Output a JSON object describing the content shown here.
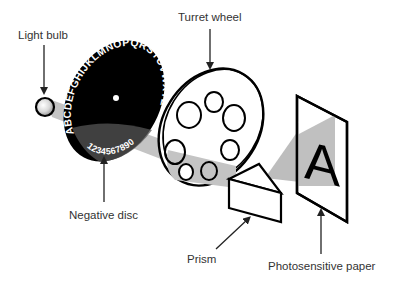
{
  "diagram": {
    "labels": {
      "light_bulb": "Light bulb",
      "turret_wheel": "Turret wheel",
      "negative_disc": "Negative disc",
      "prism": "Prism",
      "photosensitive_paper": "Photosensitive paper"
    },
    "disc_text": {
      "letters": "ABCDEFGHIJKLMNOPQRSTUVWXYZ",
      "digits": "1234567890"
    },
    "projected_letter": "A",
    "colors": {
      "outline": "#000000",
      "beam": "#bdbdbd",
      "disc": "#000000",
      "label_text": "#333333",
      "background": "#ffffff"
    }
  }
}
